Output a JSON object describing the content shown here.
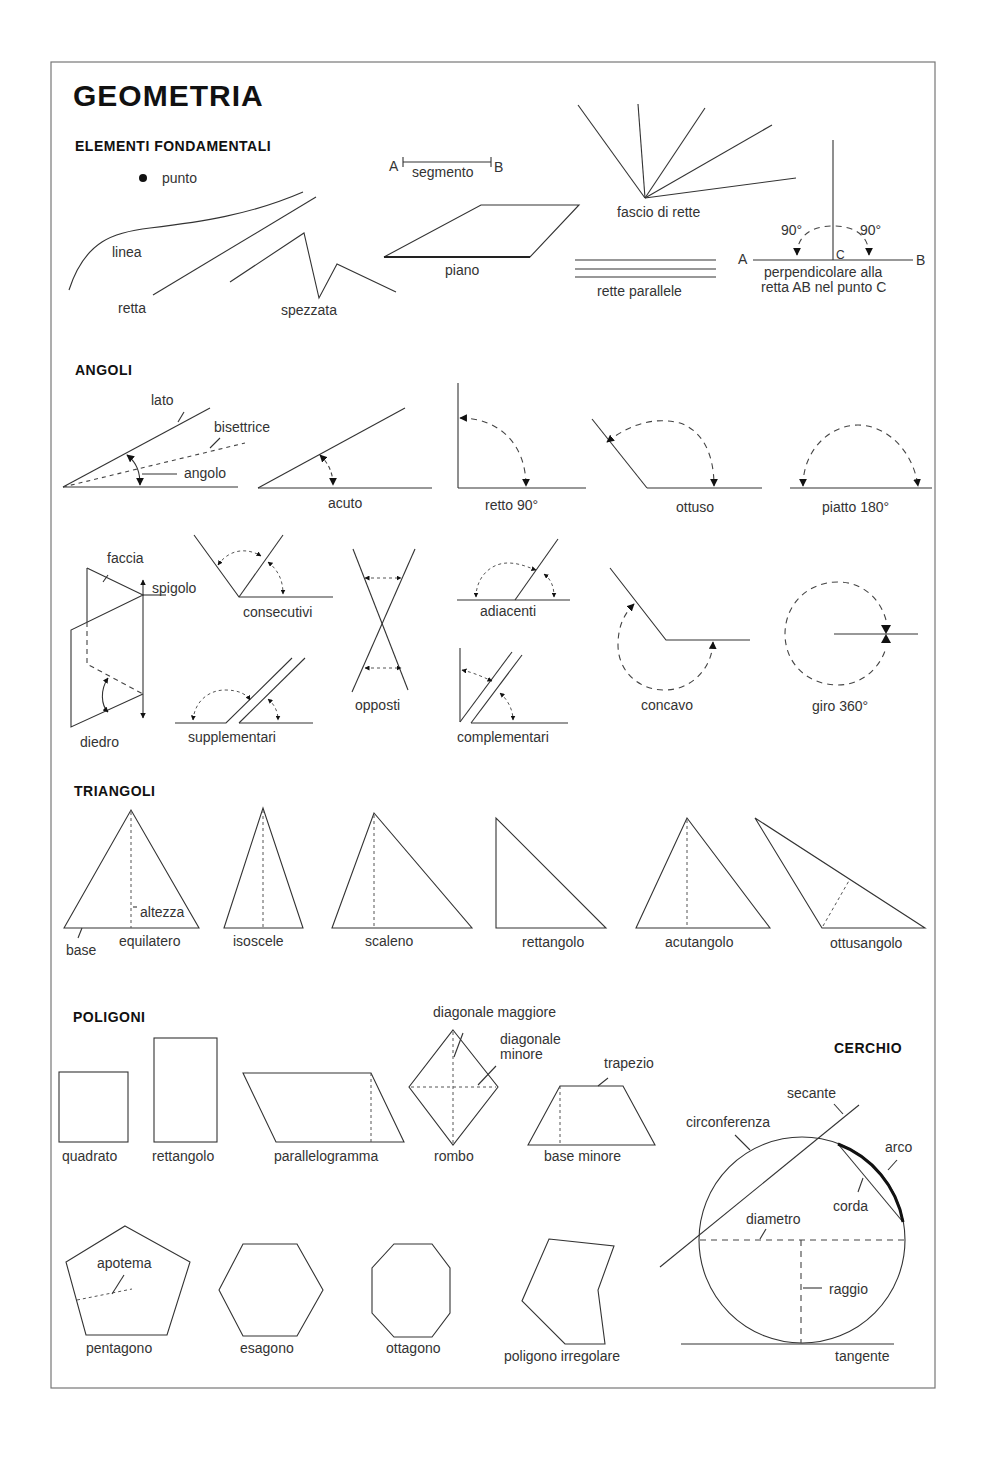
{
  "title": "GEOMETRIA",
  "sections": {
    "elementi": {
      "heading": "ELEMENTI FONDAMENTALI",
      "labels": {
        "punto": "punto",
        "linea": "linea",
        "retta": "retta",
        "spezzata": "spezzata",
        "segmento": "segmento",
        "seg_a": "A",
        "seg_b": "B",
        "piano": "piano",
        "fascio": "fascio di rette",
        "parallele": "rette parallele",
        "perp_a": "A",
        "perp_b": "B",
        "perp_c": "C",
        "perp_90_left": "90°",
        "perp_90_right": "90°",
        "perp_line1": "perpendicolare alla",
        "perp_line2": "retta AB nel punto C"
      }
    },
    "angoli": {
      "heading": "ANGOLI",
      "labels": {
        "lato": "lato",
        "bisettrice": "bisettrice",
        "angolo": "angolo",
        "acuto": "acuto",
        "retto": "retto 90°",
        "ottuso": "ottuso",
        "piatto": "piatto 180°",
        "faccia": "faccia",
        "spigolo": "spigolo",
        "diedro": "diedro",
        "consecutivi": "consecutivi",
        "supplementari": "supplementari",
        "opposti": "opposti",
        "adiacenti": "adiacenti",
        "complementari": "complementari",
        "concavo": "concavo",
        "giro": "giro 360°"
      }
    },
    "triangoli": {
      "heading": "TRIANGOLI",
      "labels": {
        "altezza": "altezza",
        "base": "base",
        "equilatero": "equilatero",
        "isoscele": "isoscele",
        "scaleno": "scaleno",
        "rettangolo": "rettangolo",
        "acutangolo": "acutangolo",
        "ottusangolo": "ottusangolo"
      }
    },
    "poligoni": {
      "heading": "POLIGONI",
      "labels": {
        "quadrato": "quadrato",
        "rettangolo": "rettangolo",
        "parallelogramma": "parallelogramma",
        "diag_magg": "diagonale maggiore",
        "diag_min1": "diagonale",
        "diag_min2": "minore",
        "rombo": "rombo",
        "trapezio": "trapezio",
        "base_minore": "base minore",
        "apotema": "apotema",
        "pentagono": "pentagono",
        "esagono": "esagono",
        "ottagono": "ottagono",
        "irregolare": "poligono irregolare"
      }
    },
    "cerchio": {
      "heading": "CERCHIO",
      "labels": {
        "secante": "secante",
        "circonferenza": "circonferenza",
        "arco": "arco",
        "corda": "corda",
        "diametro": "diametro",
        "raggio": "raggio",
        "tangente": "tangente"
      }
    }
  }
}
